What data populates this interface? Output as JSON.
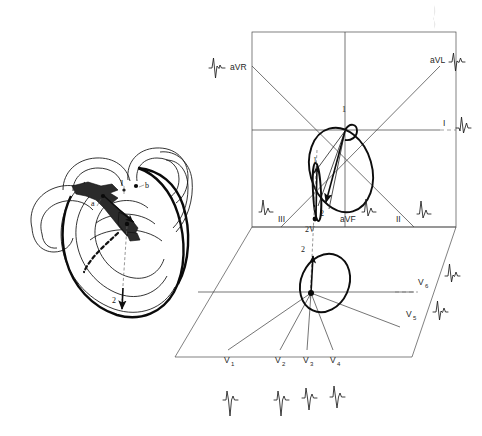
{
  "figure": {
    "panels": [
      {
        "id": "heart-panel",
        "name": "Heart cross-section with activation vectors"
      },
      {
        "id": "lead-panel",
        "name": "Three-dimensional lead reference system"
      }
    ]
  },
  "heart_diagram": {
    "labels": [
      {
        "key": "vector1",
        "text": "1"
      },
      {
        "key": "point_a",
        "text": "a"
      },
      {
        "key": "point_b",
        "text": "b"
      },
      {
        "key": "vector2",
        "text": "2"
      }
    ]
  },
  "frontal_plane": {
    "name": "frontal-plane",
    "loop_labels": [
      {
        "key": "loop_start",
        "text": "1"
      },
      {
        "key": "loop_end",
        "text": "2"
      },
      {
        "key": "sagittal_start",
        "text": "1"
      },
      {
        "key": "sagittal_end",
        "text": "2V"
      }
    ],
    "leads": [
      {
        "key": "aVR",
        "label": "aVR",
        "sub": ""
      },
      {
        "key": "aVL",
        "label": "aVL",
        "sub": ""
      },
      {
        "key": "I",
        "label": "I",
        "sub": ""
      },
      {
        "key": "II",
        "label": "II",
        "sub": ""
      },
      {
        "key": "III",
        "label": "III",
        "sub": ""
      },
      {
        "key": "aVF",
        "label": "aVF",
        "sub": ""
      }
    ]
  },
  "horizontal_plane": {
    "name": "horizontal-plane",
    "loop_labels": [
      {
        "key": "loop_end",
        "text": "2"
      }
    ],
    "leads": [
      {
        "key": "V1",
        "label": "V",
        "sub": "1"
      },
      {
        "key": "V2",
        "label": "V",
        "sub": "2"
      },
      {
        "key": "V3",
        "label": "V",
        "sub": "3"
      },
      {
        "key": "V4",
        "label": "V",
        "sub": "4"
      },
      {
        "key": "V5",
        "label": "V",
        "sub": "5"
      },
      {
        "key": "V6",
        "label": "V",
        "sub": "6"
      }
    ]
  },
  "ecg_traces": [
    {
      "key": "aVR",
      "lead": "aVR",
      "morphology": "predominantly-negative-QS",
      "position": "upper-left"
    },
    {
      "key": "aVL",
      "lead": "aVL",
      "morphology": "biphasic-rS",
      "position": "upper-right"
    },
    {
      "key": "I",
      "lead": "I",
      "morphology": "positive-qR",
      "position": "right-middle"
    },
    {
      "key": "II",
      "lead": "II",
      "morphology": "tall-positive-R",
      "position": "lower-right"
    },
    {
      "key": "III",
      "lead": "III",
      "morphology": "positive-R",
      "position": "lower-left"
    },
    {
      "key": "aVF",
      "lead": "aVF",
      "morphology": "tall-positive-R",
      "position": "lower-center"
    },
    {
      "key": "V1",
      "lead": "V1",
      "morphology": "rS-deep-S",
      "position": "bottom-row"
    },
    {
      "key": "V2",
      "lead": "V2",
      "morphology": "rS-deep-S",
      "position": "bottom-row"
    },
    {
      "key": "V3",
      "lead": "V3",
      "morphology": "rS-transition",
      "position": "bottom-row"
    },
    {
      "key": "V4",
      "lead": "V4",
      "morphology": "Rs-transition",
      "position": "bottom-row"
    },
    {
      "key": "V5",
      "lead": "V5",
      "morphology": "qRs",
      "position": "right-side"
    },
    {
      "key": "V6",
      "lead": "V6",
      "morphology": "qRs-small-s",
      "position": "right-side"
    }
  ],
  "colors": {
    "ink": "#1a1a1a",
    "axis": "#3a3a3a",
    "loop": "#0d0d0d",
    "background": "#ffffff"
  }
}
